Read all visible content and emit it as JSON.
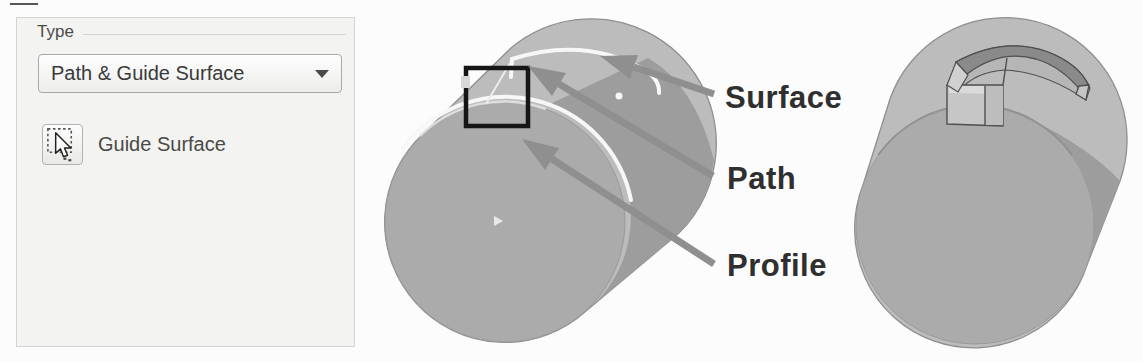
{
  "panel": {
    "group_label": "Type",
    "type_dropdown": {
      "value": "Path & Guide Surface"
    },
    "guide_surface_button": {
      "label": "Guide Surface",
      "icon": "cursor-select-icon"
    }
  },
  "illustration": {
    "labels": {
      "surface": "Surface",
      "path": "Path",
      "profile": "Profile"
    }
  },
  "colors": {
    "page-bg": "#fcfcfc",
    "panel-bg": "#f3f3f1",
    "panel-border": "#d4d4d2",
    "control-border": "#a8a8a6",
    "control-text": "#3a3a3a",
    "cyl-top": "#bcbcbc",
    "cyl-front": "#ababab",
    "cyl-shadow": "#9d9d9d",
    "cyl-edge": "#8f8f8f",
    "white-line": "#f7f7f7",
    "profile-outline": "#161616",
    "arrow-color": "#8f8f8f",
    "label-color": "#2f2f2f",
    "groove-dark": "#8a8a8a",
    "groove-floor": "#b6b6b6",
    "groove-face": "#c6c6c6",
    "groove-edge": "#4f4f4f"
  }
}
